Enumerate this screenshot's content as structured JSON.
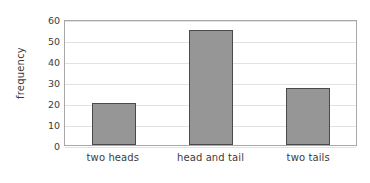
{
  "chart_data": {
    "type": "bar",
    "title": "",
    "xlabel": "",
    "ylabel": "frequency",
    "categories": [
      "two heads",
      "head and tail",
      "two tails"
    ],
    "values": [
      20,
      55,
      27
    ],
    "ylim": [
      0,
      60
    ],
    "yticks": [
      0,
      10,
      20,
      30,
      40,
      50,
      60
    ],
    "ytick_labels": [
      "0",
      "10",
      "20",
      "30",
      "40",
      "50",
      "60"
    ],
    "grid": true,
    "legend": false,
    "colors": {
      "bar_fill": "#969696",
      "bar_border": "#4a4a4a",
      "gridline": "#e2e2e2",
      "axis_border": "#a8a8a8",
      "text": "#3c3c3c",
      "background": "#ffffff"
    }
  }
}
